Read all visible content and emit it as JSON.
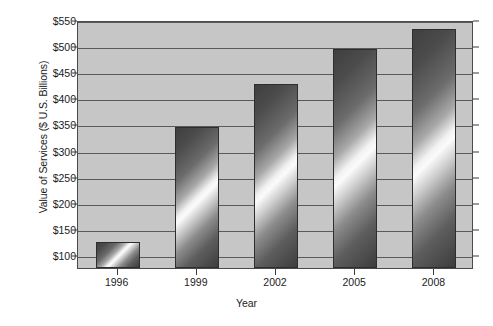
{
  "chart_data": {
    "type": "bar",
    "title": "",
    "xlabel": "Year",
    "ylabel": "Value of Services ($ U.S. Billions)",
    "categories": [
      "1996",
      "1999",
      "2002",
      "2005",
      "2008"
    ],
    "values": [
      125,
      345,
      427,
      495,
      532
    ],
    "ylim": [
      75,
      550
    ],
    "ytick_labels": [
      "$100",
      "$150",
      "$200",
      "$250",
      "$300",
      "$350",
      "$400",
      "$450",
      "$500",
      "$550"
    ],
    "ytick_values": [
      100,
      150,
      200,
      250,
      300,
      350,
      400,
      450,
      500,
      550
    ],
    "grid": true,
    "legend": "none",
    "plot_background_color": "#c6c6c6",
    "bar_style": "metallic-diagonal-gradient",
    "axis_color": "#4a4a4a"
  }
}
